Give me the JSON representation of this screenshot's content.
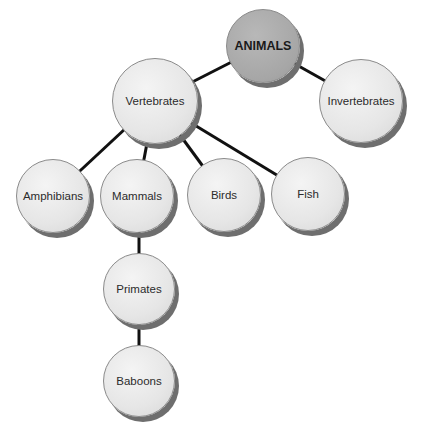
{
  "diagram": {
    "type": "hierarchy-tree",
    "colors": {
      "root_fill": "#a8a8a8",
      "node_fill": "#e8e8e8",
      "edge": "#111111",
      "shadow": "#6e6e6e"
    },
    "nodes": {
      "animals": {
        "label": "ANIMALS",
        "cx": 263,
        "cy": 46,
        "r": 37
      },
      "vertebrates": {
        "label": "Vertebrates",
        "cx": 155,
        "cy": 101,
        "r": 43
      },
      "invertebrates": {
        "label": "Invertebrates",
        "cx": 361,
        "cy": 101,
        "r": 42
      },
      "amphibians": {
        "label": "Amphibians",
        "cx": 53,
        "cy": 196,
        "r": 37
      },
      "mammals": {
        "label": "Mammals",
        "cx": 137,
        "cy": 196,
        "r": 37
      },
      "birds": {
        "label": "Birds",
        "cx": 224,
        "cy": 195,
        "r": 37
      },
      "fish": {
        "label": "Fish",
        "cx": 308,
        "cy": 194,
        "r": 37
      },
      "primates": {
        "label": "Primates",
        "cx": 139,
        "cy": 289,
        "r": 36
      },
      "baboons": {
        "label": "Baboons",
        "cx": 139,
        "cy": 381,
        "r": 36
      }
    },
    "edges": [
      [
        "animals",
        "vertebrates"
      ],
      [
        "animals",
        "invertebrates"
      ],
      [
        "vertebrates",
        "amphibians"
      ],
      [
        "vertebrates",
        "mammals"
      ],
      [
        "vertebrates",
        "birds"
      ],
      [
        "vertebrates",
        "fish"
      ],
      [
        "mammals",
        "primates"
      ],
      [
        "primates",
        "baboons"
      ]
    ]
  }
}
